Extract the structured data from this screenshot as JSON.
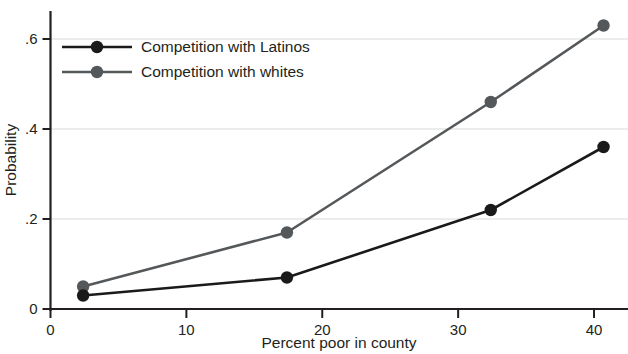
{
  "chart_data": {
    "type": "line",
    "title": "",
    "subtitle": "",
    "xlabel": "Percent poor in county",
    "ylabel": "Probability",
    "x": [
      2.4,
      17.4,
      32.4,
      40.7
    ],
    "xlim": [
      0,
      42.5
    ],
    "ylim": [
      0,
      0.66
    ],
    "xticks": [
      0,
      10,
      20,
      30,
      40
    ],
    "xtick_labels": [
      "0",
      "10",
      "20",
      "30",
      "40"
    ],
    "yticks": [
      0,
      0.2,
      0.4,
      0.6
    ],
    "ytick_labels": [
      "0",
      ".2",
      ".4",
      ".6"
    ],
    "grid": "horizontal",
    "legend_position": "top-left-inside",
    "series": [
      {
        "name": "Competition with Latinos",
        "color": "#1a1a1a",
        "marker": "circle",
        "values": [
          0.03,
          0.07,
          0.22,
          0.36
        ]
      },
      {
        "name": "Competition with whites",
        "color": "#55585a",
        "marker": "circle",
        "values": [
          0.05,
          0.17,
          0.46,
          0.63
        ]
      }
    ]
  },
  "legend": {
    "entries": [
      {
        "label": "Competition with Latinos"
      },
      {
        "label": "Competition with whites"
      }
    ]
  },
  "axes": {
    "y_title": "Probability",
    "x_title": "Percent poor in county"
  },
  "colors": {
    "series_latinos": "#1a1a1a",
    "series_whites": "#55585a",
    "axis": "#231f20",
    "grid": "#d9d9d9",
    "background": "#ffffff"
  }
}
